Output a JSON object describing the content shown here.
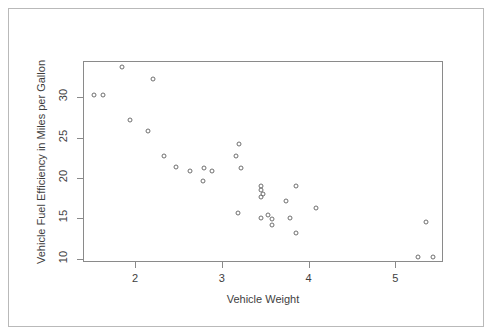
{
  "chart_data": {
    "type": "scatter",
    "title": "",
    "xlabel": "Vehicle Weight",
    "ylabel": "Vehicle Fuel Efficiency in Miles per Gallon",
    "xlim": [
      1.4,
      5.55
    ],
    "ylim": [
      9.6,
      34.5
    ],
    "xticks": [
      2,
      3,
      4,
      5
    ],
    "xticklabels": [
      "2",
      "3",
      "4",
      "5"
    ],
    "yticks": [
      10,
      15,
      20,
      25,
      30
    ],
    "yticklabels": [
      "10",
      "15",
      "20",
      "25",
      "30"
    ],
    "grid": false,
    "legend": null,
    "marker": "open-circle",
    "marker_color": "#6f6f6f",
    "x": [
      2.62,
      2.875,
      2.32,
      3.215,
      3.44,
      3.46,
      3.57,
      3.19,
      3.15,
      3.44,
      3.44,
      4.07,
      3.73,
      3.78,
      5.25,
      5.424,
      5.345,
      2.2,
      1.615,
      1.835,
      2.465,
      3.52,
      3.435,
      3.84,
      3.845,
      1.935,
      2.14,
      1.513,
      3.17,
      2.77,
      3.57,
      2.78
    ],
    "y": [
      21.0,
      21.0,
      22.8,
      21.4,
      18.7,
      18.1,
      14.3,
      24.4,
      22.8,
      19.2,
      17.8,
      16.4,
      17.3,
      15.2,
      10.4,
      10.4,
      14.7,
      32.4,
      30.4,
      33.9,
      21.5,
      15.5,
      15.2,
      13.3,
      19.2,
      27.3,
      26.0,
      30.4,
      15.8,
      19.7,
      15.0,
      21.4
    ]
  },
  "axes": {
    "x_label": "Vehicle Weight",
    "y_label": "Vehicle Fuel Efficiency in Miles per Gallon"
  },
  "colors": {
    "outer_border": "#b9b9b9",
    "plot_border": "#8a8a8a",
    "marker": "#6f6f6f",
    "text": "#3e3e3e",
    "background": "#ffffff"
  }
}
